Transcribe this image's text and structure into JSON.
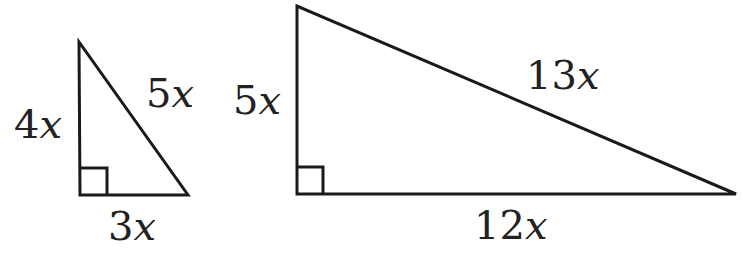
{
  "diagram": {
    "stroke_color": "#1a1a1a",
    "triangles": [
      {
        "name": "small-triangle",
        "vertices": {
          "apex": [
            79,
            42
          ],
          "right_angle": [
            80,
            195
          ],
          "base_end": [
            188,
            195
          ]
        },
        "right_angle_marker_size": 27,
        "labels": {
          "vertical_leg": {
            "coef": "4",
            "var": "x"
          },
          "hypotenuse": {
            "coef": "5",
            "var": "x"
          },
          "base": {
            "coef": "3",
            "var": "x"
          }
        }
      },
      {
        "name": "large-triangle",
        "vertices": {
          "apex": [
            297,
            6
          ],
          "right_angle": [
            297,
            194
          ],
          "base_end": [
            736,
            194
          ]
        },
        "right_angle_marker_size": 26,
        "labels": {
          "vertical_leg": {
            "coef": "5",
            "var": "x"
          },
          "hypotenuse": {
            "coef": "13",
            "var": "x"
          },
          "base": {
            "coef": "12",
            "var": "x"
          }
        }
      }
    ]
  }
}
